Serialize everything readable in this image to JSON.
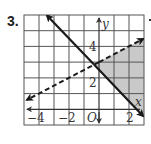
{
  "problem": {
    "number_label": "3."
  },
  "graph": {
    "x_axis_label": "x",
    "y_axis_label": "y",
    "origin_label": "O",
    "x_tick_labels": [
      {
        "value": -4,
        "text": "−4"
      },
      {
        "value": -2,
        "text": "−2"
      },
      {
        "value": 2,
        "text": "2"
      }
    ],
    "y_tick_labels": [
      {
        "value": 4,
        "text": "4"
      },
      {
        "value": 2,
        "text": "2"
      }
    ],
    "grid": {
      "x_min": -5,
      "x_max": 3,
      "y_min": -1,
      "y_max": 6,
      "step": 1
    },
    "lines": [
      {
        "name": "boundary-solid",
        "equation": "y = -x + 2.5",
        "style": "solid"
      },
      {
        "name": "boundary-dashed",
        "equation": "y = 0.5x + 3",
        "style": "dashed"
      }
    ],
    "shaded_region": "right of solid line and below dashed line",
    "colors": {
      "grid": "#555555",
      "line": "#1a1a1a",
      "shade": "#c9c9c9",
      "text": "#333333"
    }
  }
}
